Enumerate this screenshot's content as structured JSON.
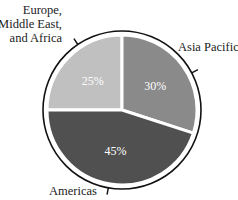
{
  "chart_data": {
    "type": "pie",
    "title": "",
    "categories": [
      "Europe, Middle East, and Africa",
      "Asia Pacific",
      "Americas"
    ],
    "values": [
      25,
      30,
      45
    ],
    "value_labels": [
      "25%",
      "30%",
      "45%"
    ],
    "colors": [
      "#c0c0c0",
      "#8a8a8a",
      "#505050"
    ],
    "start_angle_deg": 0,
    "direction": "clockwise",
    "legend": "none (callout labels)",
    "label_lines": {
      "emea": [
        "Europe,",
        "Middle East,",
        "and Africa"
      ],
      "asia_pacific": "Asia Pacific",
      "americas": "Americas"
    }
  },
  "geometry": {
    "cx": 122,
    "cy": 110,
    "pie_r": 75,
    "ring_r": 79
  }
}
